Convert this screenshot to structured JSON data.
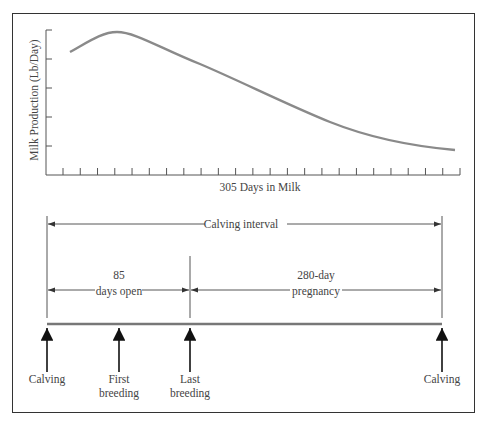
{
  "chart_data": {
    "type": "line",
    "title": "",
    "xlabel": "305 Days in Milk",
    "ylabel": "Milk Production (Lb/Day)",
    "x_ticks": 24,
    "y_ticks": 5,
    "grid": false,
    "series": [
      {
        "name": "Lactation curve",
        "x_relative": [
          0.0,
          0.05,
          0.12,
          0.2,
          0.3,
          0.45,
          0.6,
          0.75,
          0.9,
          1.0
        ],
        "y_relative": [
          0.83,
          0.93,
          0.98,
          0.88,
          0.77,
          0.62,
          0.47,
          0.35,
          0.22,
          0.16
        ]
      }
    ],
    "colors": {
      "curve": "#8a8a8a",
      "axes": "#555555"
    }
  },
  "timeline": {
    "calving_interval_label": "Calving interval",
    "days_open_value": "85",
    "days_open_label": "days open",
    "pregnancy_value": "280-day",
    "pregnancy_label": "pregnancy",
    "events": [
      {
        "line1": "Calving",
        "line2": ""
      },
      {
        "line1": "First",
        "line2": "breeding"
      },
      {
        "line1": "Last",
        "line2": "breeding"
      },
      {
        "line1": "Calving",
        "line2": ""
      }
    ]
  }
}
